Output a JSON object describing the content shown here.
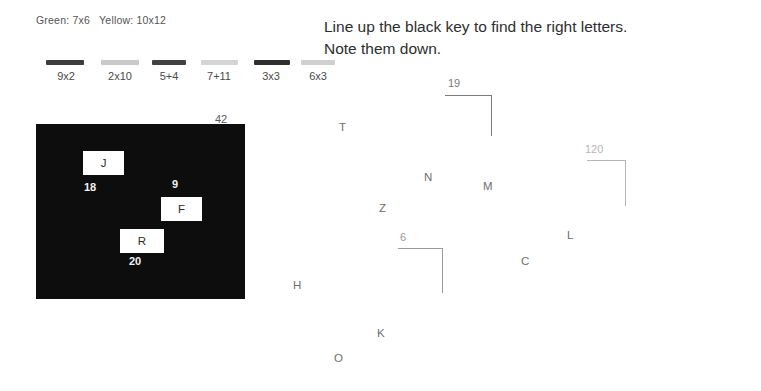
{
  "legend": {
    "text": "Green: 7x6   Yellow: 10x12"
  },
  "swatches": [
    {
      "label": "9x2",
      "color": "#3d3d3d",
      "x": 46,
      "y": 60,
      "w": 38,
      "lx": 46,
      "lw": 40
    },
    {
      "label": "2x10",
      "color": "#c9c9c9",
      "x": 101,
      "y": 60,
      "w": 38,
      "lx": 99,
      "lw": 42
    },
    {
      "label": "5+4",
      "color": "#424242",
      "x": 152,
      "y": 60,
      "w": 34,
      "lx": 149,
      "lw": 40
    },
    {
      "label": "7+11",
      "color": "#d5d5d5",
      "x": 201,
      "y": 60,
      "w": 37,
      "lx": 198,
      "lw": 42
    },
    {
      "label": "3x3",
      "color": "#2f2f2f",
      "x": 254,
      "y": 60,
      "w": 36,
      "lx": 251,
      "lw": 40
    },
    {
      "label": "6x3",
      "color": "#d0d0d0",
      "x": 301,
      "y": 60,
      "w": 34,
      "lx": 298,
      "lw": 40
    }
  ],
  "key_box": {
    "top_label": "42",
    "cells": [
      {
        "letter": "J",
        "x": 47,
        "y": 27,
        "w": 41,
        "h": 24,
        "num": "18",
        "nx": 48,
        "ny": 57
      },
      {
        "letter": "F",
        "x": 125,
        "y": 73,
        "w": 41,
        "h": 24,
        "num": "9",
        "nx": 136,
        "ny": 54
      },
      {
        "letter": "R",
        "x": 84,
        "y": 105,
        "w": 44,
        "h": 24,
        "num": "20",
        "nx": 93,
        "ny": 131
      }
    ]
  },
  "instructions": {
    "line1": "Line up the black key to find the right letters.",
    "line2": "Note them down."
  },
  "field_letters": [
    {
      "label": "T",
      "x": 339,
      "y": 121
    },
    {
      "label": "N",
      "x": 424,
      "y": 171
    },
    {
      "label": "M",
      "x": 483,
      "y": 180
    },
    {
      "label": "Z",
      "x": 379,
      "y": 202
    },
    {
      "label": "L",
      "x": 567,
      "y": 229
    },
    {
      "label": "C",
      "x": 521,
      "y": 255
    },
    {
      "label": "H",
      "x": 293,
      "y": 279
    },
    {
      "label": "K",
      "x": 377,
      "y": 327
    },
    {
      "label": "O",
      "x": 334,
      "y": 352
    }
  ],
  "brackets": [
    {
      "label": "19",
      "x": 445,
      "y": 95,
      "w": 47,
      "h": 41,
      "color": "#7a7a7a",
      "label_x": 448,
      "label_y": -18
    },
    {
      "label": "120",
      "x": 587,
      "y": 160,
      "w": 39,
      "h": 46,
      "color": "#b5b5b5",
      "label_x": 585,
      "label_y": -17
    },
    {
      "label": "6",
      "x": 398,
      "y": 248,
      "w": 45,
      "h": 45,
      "color": "#9a9a9a",
      "label_x": 400,
      "label_y": -17
    }
  ]
}
